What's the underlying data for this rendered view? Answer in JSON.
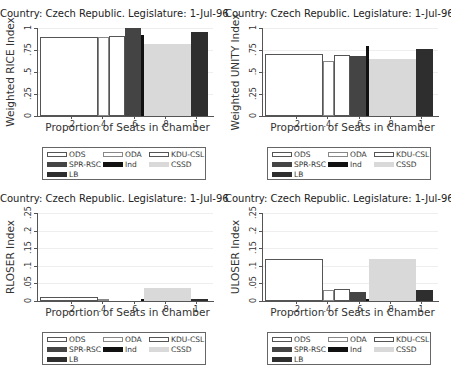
{
  "chart_data": [
    {
      "type": "bar",
      "title": "Country: Czech Republic. Legislature: 1-Jul-96",
      "xlabel": "Proportion of Seats in Chamber",
      "ylabel": "Weighted RICE Index",
      "ylim": [
        0,
        1
      ],
      "yticks": [
        "0",
        ".25",
        ".5",
        ".75",
        "1"
      ],
      "xticks": [
        ".2",
        ".4",
        ".6",
        ".8",
        "1"
      ],
      "grid": true,
      "legend_position": "bottom",
      "series": [
        {
          "name": "ODS",
          "x0": 0.0,
          "x1": 0.37,
          "value": 0.9
        },
        {
          "name": "ODA",
          "x0": 0.37,
          "x1": 0.445,
          "value": 0.9
        },
        {
          "name": "KDU-CSL",
          "x0": 0.445,
          "x1": 0.545,
          "value": 0.91
        },
        {
          "name": "SPR-RSC",
          "x0": 0.545,
          "x1": 0.645,
          "value": 1.0
        },
        {
          "name": "Ind",
          "x0": 0.645,
          "x1": 0.665,
          "value": 0.92
        },
        {
          "name": "CSSD",
          "x0": 0.665,
          "x1": 0.965,
          "value": 0.82
        },
        {
          "name": "LB",
          "x0": 0.965,
          "x1": 1.075,
          "value": 0.95
        }
      ]
    },
    {
      "type": "bar",
      "title": "Country: Czech Republic. Legislature: 1-Jul-96",
      "xlabel": "Proportion of Seats in Chamber",
      "ylabel": "Weighted UNITY Index",
      "ylim": [
        0,
        1
      ],
      "yticks": [
        "0",
        ".25",
        ".5",
        ".75",
        "1"
      ],
      "xticks": [
        ".2",
        ".4",
        ".6",
        ".8",
        "1"
      ],
      "grid": true,
      "legend_position": "bottom",
      "series": [
        {
          "name": "ODS",
          "x0": 0.0,
          "x1": 0.37,
          "value": 0.7
        },
        {
          "name": "ODA",
          "x0": 0.37,
          "x1": 0.445,
          "value": 0.63
        },
        {
          "name": "KDU-CSL",
          "x0": 0.445,
          "x1": 0.545,
          "value": 0.69
        },
        {
          "name": "SPR-RSC",
          "x0": 0.545,
          "x1": 0.645,
          "value": 0.68
        },
        {
          "name": "Ind",
          "x0": 0.645,
          "x1": 0.665,
          "value": 0.8
        },
        {
          "name": "CSSD",
          "x0": 0.665,
          "x1": 0.965,
          "value": 0.65
        },
        {
          "name": "LB",
          "x0": 0.965,
          "x1": 1.075,
          "value": 0.76
        }
      ]
    },
    {
      "type": "bar",
      "title": "Country: Czech Republic.  Legislature: 1-Jul-96",
      "xlabel": "Proportion of Seats in Chamber",
      "ylabel": "RLOSER Index",
      "ylim": [
        0,
        0.25
      ],
      "yticks": [
        "0",
        ".05",
        ".1",
        ".15",
        ".2",
        ".25"
      ],
      "xticks": [
        ".2",
        ".4",
        ".6",
        ".8",
        "1"
      ],
      "grid": true,
      "legend_position": "bottom",
      "series": [
        {
          "name": "ODS",
          "x0": 0.0,
          "x1": 0.37,
          "value": 0.012
        },
        {
          "name": "ODA",
          "x0": 0.37,
          "x1": 0.445,
          "value": 0.003
        },
        {
          "name": "KDU-CSL",
          "x0": 0.445,
          "x1": 0.545,
          "value": 0.0
        },
        {
          "name": "SPR-RSC",
          "x0": 0.545,
          "x1": 0.645,
          "value": 0.0
        },
        {
          "name": "Ind",
          "x0": 0.645,
          "x1": 0.665,
          "value": 0.002
        },
        {
          "name": "CSSD",
          "x0": 0.665,
          "x1": 0.965,
          "value": 0.037
        },
        {
          "name": "LB",
          "x0": 0.965,
          "x1": 1.075,
          "value": 0.004
        }
      ]
    },
    {
      "type": "bar",
      "title": "Country: Czech Republic. Legislature: 1-Jul-96",
      "xlabel": "Proportion of Seats in Chamber",
      "ylabel": "ULOSER Index",
      "ylim": [
        0,
        0.25
      ],
      "yticks": [
        "0",
        ".05",
        ".1",
        ".15",
        ".2",
        ".25"
      ],
      "xticks": [
        ".2",
        ".4",
        ".6",
        ".8",
        "1"
      ],
      "grid": true,
      "legend_position": "bottom",
      "series": [
        {
          "name": "ODS",
          "x0": 0.0,
          "x1": 0.37,
          "value": 0.118
        },
        {
          "name": "ODA",
          "x0": 0.37,
          "x1": 0.445,
          "value": 0.03
        },
        {
          "name": "KDU-CSL",
          "x0": 0.445,
          "x1": 0.545,
          "value": 0.035
        },
        {
          "name": "SPR-RSC",
          "x0": 0.545,
          "x1": 0.645,
          "value": 0.025
        },
        {
          "name": "Ind",
          "x0": 0.645,
          "x1": 0.665,
          "value": 0.002
        },
        {
          "name": "CSSD",
          "x0": 0.665,
          "x1": 0.965,
          "value": 0.118
        },
        {
          "name": "LB",
          "x0": 0.965,
          "x1": 1.075,
          "value": 0.03
        }
      ]
    }
  ],
  "legend": [
    {
      "name": "ODS",
      "fill": "#ffffff",
      "border": "#555555"
    },
    {
      "name": "ODA",
      "fill": "#ffffff",
      "border": "#888888"
    },
    {
      "name": "KDU-CSL",
      "fill": "#ffffff",
      "border": "#555555"
    },
    {
      "name": "SPR-RSC",
      "fill": "#444444",
      "border": "#444444"
    },
    {
      "name": "Ind",
      "fill": "#111111",
      "border": "#111111"
    },
    {
      "name": "CSSD",
      "fill": "#d9d9d9",
      "border": "#d9d9d9"
    },
    {
      "name": "LB",
      "fill": "#2e2e2e",
      "border": "#2e2e2e"
    }
  ]
}
